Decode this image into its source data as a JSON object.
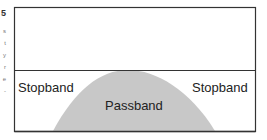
{
  "diagram": {
    "edge_fragments": {
      "number": "5",
      "letters": [
        "s",
        "t",
        "y",
        "r",
        "e",
        "-"
      ]
    },
    "labels": {
      "stopband_left": "Stopband",
      "stopband_right": "Stopband",
      "passband": "Passband"
    },
    "colors": {
      "border": "#333333",
      "passband_fill": "#c8c8c8",
      "background": "#ffffff",
      "text": "#222222"
    }
  }
}
